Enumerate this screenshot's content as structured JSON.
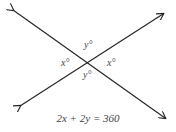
{
  "diagram": {
    "angle_labels": {
      "top": "y°",
      "left": "x°",
      "right": "x°",
      "bottom": "y°"
    },
    "equation": "2x + 2y = 360",
    "line_color": "#222222",
    "text_color": "#444444"
  }
}
